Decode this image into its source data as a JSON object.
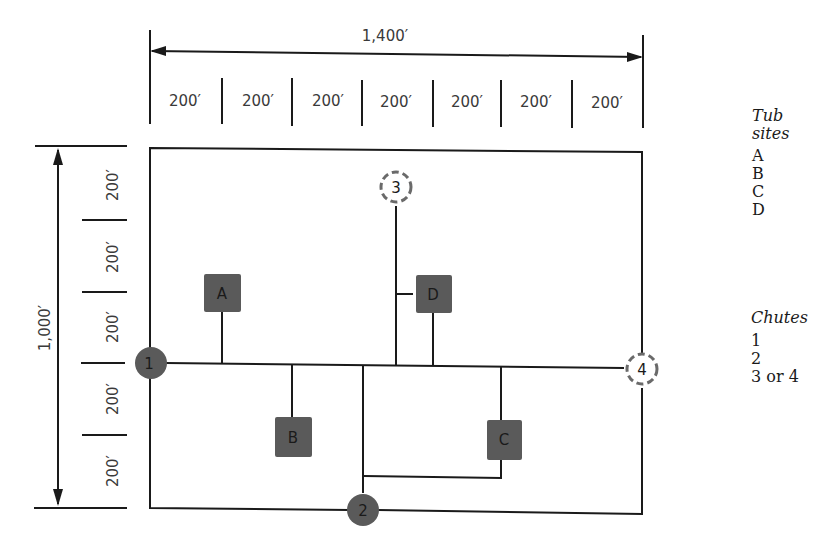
{
  "dimensions": {
    "width_total": "1,400′",
    "height_total": "1,000′",
    "segment_label": "200′",
    "width_segments": [
      "200′",
      "200′",
      "200′",
      "200′",
      "200′",
      "200′",
      "200′"
    ],
    "height_segments": [
      "200′",
      "200′",
      "200′",
      "200′",
      "200′"
    ]
  },
  "tub_sites": [
    {
      "label": "A"
    },
    {
      "label": "B"
    },
    {
      "label": "C"
    },
    {
      "label": "D"
    }
  ],
  "chutes": [
    {
      "label": "1",
      "style": "solid"
    },
    {
      "label": "2",
      "style": "solid"
    },
    {
      "label": "3",
      "style": "dashed"
    },
    {
      "label": "4",
      "style": "dashed"
    }
  ],
  "legend": {
    "tub_heading_line1": "Tub",
    "tub_heading_line2": "sites",
    "tub_items": [
      "A",
      "B",
      "C",
      "D"
    ],
    "chutes_heading": "Chutes",
    "chute_items": [
      "1",
      "2",
      "3 or 4"
    ]
  },
  "colors": {
    "node_fill": "#5a5a5a",
    "line": "#1a1a1a"
  }
}
